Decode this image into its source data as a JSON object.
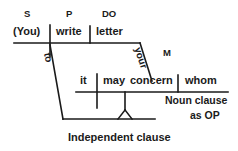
{
  "diagram": {
    "type": "reed-kellogg-sentence-diagram",
    "sentence": "(You) write letter to whom it may concern",
    "stroke_color": "#1a1a1a",
    "background_color": "#ffffff",
    "main_clause": {
      "role_tags": [
        {
          "id": "subject-tag",
          "text": "S"
        },
        {
          "id": "predicate-tag",
          "text": "P"
        },
        {
          "id": "direct-object-tag",
          "text": "DO"
        }
      ],
      "words": [
        {
          "id": "subject",
          "text": "(You)"
        },
        {
          "id": "predicate",
          "text": "write"
        },
        {
          "id": "direct-object",
          "text": "letter"
        }
      ]
    },
    "modifier": {
      "slant_word": "your",
      "tag": "M"
    },
    "preposition": {
      "slant_word": "to"
    },
    "noun_clause": {
      "words": [
        {
          "id": "clause-subject",
          "text": "it"
        },
        {
          "id": "clause-aux",
          "text": "may"
        },
        {
          "id": "clause-verb",
          "text": "concern"
        },
        {
          "id": "clause-object",
          "text": "whom"
        }
      ]
    },
    "annotations": {
      "noun_clause_label_line1": "Noun clause",
      "noun_clause_label_line2": "as OP",
      "independent_clause_label": "Independent clause"
    }
  }
}
